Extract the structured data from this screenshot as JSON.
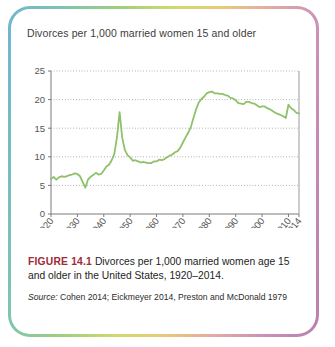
{
  "figure": {
    "label": "FIGURE 14.1",
    "caption": " Divorces per 1,000 married women age 15 and older in the United States, 1920–2014.",
    "source_word": "Source:",
    "source_text": " Cohen 2014; Eickmeyer 2014, Preston and McDonald 1979",
    "label_color": "#9e2b37"
  },
  "chart_data": {
    "type": "line",
    "title": "Divorces per 1,000 married women 15 and older",
    "xlabel": "",
    "ylabel": "",
    "line_color": "#8fc06a",
    "grid": true,
    "legend": "none",
    "xlim": [
      1920,
      2014
    ],
    "ylim": [
      0,
      25
    ],
    "yticks": [
      0,
      5,
      10,
      15,
      20,
      25
    ],
    "xticks": [
      1920,
      1930,
      1940,
      1950,
      1960,
      1970,
      1980,
      1990,
      2000,
      2010,
      2014
    ],
    "x": [
      1920,
      1921,
      1922,
      1923,
      1924,
      1925,
      1926,
      1927,
      1928,
      1929,
      1930,
      1931,
      1932,
      1933,
      1934,
      1935,
      1936,
      1937,
      1938,
      1939,
      1940,
      1941,
      1942,
      1943,
      1944,
      1945,
      1946,
      1947,
      1948,
      1949,
      1950,
      1951,
      1952,
      1953,
      1954,
      1955,
      1956,
      1957,
      1958,
      1959,
      1960,
      1961,
      1962,
      1963,
      1964,
      1965,
      1966,
      1967,
      1968,
      1969,
      1970,
      1971,
      1972,
      1973,
      1974,
      1975,
      1976,
      1977,
      1978,
      1979,
      1980,
      1981,
      1982,
      1983,
      1984,
      1985,
      1986,
      1987,
      1988,
      1989,
      1990,
      1991,
      1992,
      1993,
      1994,
      1995,
      1996,
      1997,
      1998,
      1999,
      2000,
      2001,
      2002,
      2003,
      2004,
      2005,
      2006,
      2007,
      2008,
      2009,
      2010,
      2011,
      2012,
      2013,
      2014
    ],
    "values": [
      6.1,
      6.5,
      6.0,
      6.4,
      6.6,
      6.5,
      6.6,
      6.8,
      6.9,
      7.1,
      7.0,
      6.6,
      5.6,
      4.6,
      6.0,
      6.5,
      6.8,
      7.2,
      6.9,
      7.0,
      7.6,
      8.3,
      8.6,
      9.4,
      10.5,
      13.4,
      17.8,
      13.3,
      11.2,
      10.3,
      9.9,
      9.3,
      9.4,
      9.2,
      9.0,
      9.1,
      9.0,
      8.9,
      8.9,
      9.2,
      9.2,
      9.5,
      9.4,
      9.6,
      9.9,
      10.2,
      10.4,
      10.8,
      11.0,
      11.6,
      12.5,
      13.4,
      14.2,
      15.2,
      16.8,
      18.3,
      19.5,
      20.1,
      20.5,
      21.1,
      21.3,
      21.4,
      21.1,
      21.1,
      21.0,
      21.0,
      20.8,
      20.7,
      20.3,
      20.2,
      19.9,
      19.4,
      19.3,
      19.2,
      19.6,
      19.6,
      19.4,
      19.3,
      19.0,
      18.7,
      18.8,
      18.8,
      18.5,
      18.3,
      18.0,
      17.7,
      17.5,
      17.3,
      17.1,
      16.8,
      19.1,
      18.5,
      18.2,
      17.7,
      17.6
    ]
  }
}
